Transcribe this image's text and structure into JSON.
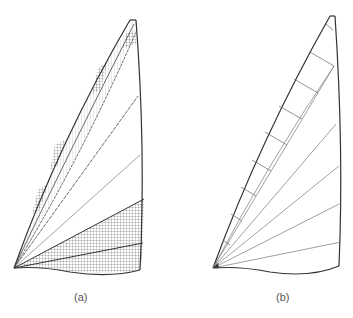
{
  "figure": {
    "panels": [
      {
        "id": "a",
        "label": "(a)",
        "description": "Sail with cross-hatched panel seams radiating from the tack",
        "style": "hatched"
      },
      {
        "id": "b",
        "label": "(b)",
        "description": "Sail outline with radial panel lines from the tack and short cross-seams along the luff",
        "style": "line"
      }
    ],
    "colors": {
      "stroke": "#333333",
      "light_stroke": "#777777",
      "background": "#ffffff"
    }
  }
}
